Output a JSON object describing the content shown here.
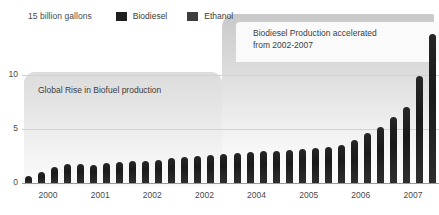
{
  "chart_data": {
    "type": "bar",
    "title": "",
    "subtitle": "",
    "xlabel": "",
    "ylabel": "15 billion gallons",
    "ylim": [
      0,
      15
    ],
    "yticks": [
      0,
      5,
      10
    ],
    "ytick_labels": [
      "0",
      "5",
      "10"
    ],
    "grid": true,
    "legend_position": "top-left",
    "legend": [
      "Biodiesel",
      "Ethanol"
    ],
    "x_tick_labels": [
      "2000",
      "2001",
      "2002",
      "2002",
      "2004",
      "2005",
      "2006",
      "2007"
    ],
    "categories": [
      "2000 Q1",
      "2000 Q2",
      "2000 Q3",
      "2000 Q4",
      "2001 Q1",
      "2001 Q2",
      "2001 Q3",
      "2001 Q4",
      "2002 Q1",
      "2002 Q2",
      "2002 Q3",
      "2002 Q4",
      "2003 Q1",
      "2003 Q2",
      "2003 Q3",
      "2003 Q4",
      "2004 Q1",
      "2004 Q2",
      "2004 Q3",
      "2004 Q4",
      "2005 Q1",
      "2005 Q2",
      "2005 Q3",
      "2005 Q4",
      "2006 Q1",
      "2006 Q2",
      "2006 Q3",
      "2006 Q4",
      "2007 Q1",
      "2007 Q2",
      "2007 Q3",
      "2007 Q4"
    ],
    "values": [
      0.7,
      1.1,
      1.6,
      1.9,
      1.9,
      1.8,
      2.0,
      2.1,
      2.2,
      2.2,
      2.3,
      2.5,
      2.6,
      2.7,
      2.8,
      2.9,
      3.0,
      3.1,
      3.2,
      3.2,
      3.3,
      3.4,
      3.5,
      3.6,
      3.8,
      4.3,
      5.0,
      5.6,
      6.6,
      7.6,
      10.6,
      14.8
    ],
    "series": [
      {
        "name": "Biodiesel",
        "color": "#1f1f1f",
        "values": [
          0.7,
          1.1,
          1.6,
          1.9,
          1.9,
          1.8,
          2.0,
          2.1,
          2.2,
          2.2,
          2.3,
          2.5,
          2.6,
          2.7,
          2.8,
          2.9,
          3.0,
          3.1,
          3.2,
          3.2,
          3.3,
          3.4,
          3.5,
          3.6,
          3.8,
          4.3,
          5.0,
          5.6,
          6.6,
          7.6,
          10.6,
          14.8
        ]
      }
    ],
    "annotations": [
      {
        "id": "global-rise",
        "text": "Global Rise in Biofuel production"
      },
      {
        "id": "biodiesel-accelerated",
        "text": "Biodiesel Production accelerated\nfrom 2002-2007"
      }
    ]
  },
  "legend": {
    "axis_top_label": "15 billion gallons",
    "items": [
      {
        "label": "Biodiesel",
        "color": "#1f1f1f"
      },
      {
        "label": "Ethanol",
        "color": "#3d3d3d"
      }
    ]
  },
  "annotations": {
    "lower": "Global Rise in Biofuel production",
    "upper": "Biodiesel Production accelerated\nfrom 2002-2007"
  },
  "axes": {
    "y_ticks": [
      "10",
      "5",
      "0"
    ],
    "x_ticks": [
      "2000",
      "2001",
      "2002",
      "2002",
      "2004",
      "2005",
      "2006",
      "2007"
    ]
  },
  "colors": {
    "bar_dark": "#1f1f1f",
    "bar_ethanol": "#3d3d3d",
    "panel_lower": "#dcdcdc",
    "panel_upper": "#c9c9c9",
    "gridline": "#d2d2d2",
    "baseline": "#9a9a9a",
    "text": "#4a4a4a",
    "background": "#ffffff"
  }
}
